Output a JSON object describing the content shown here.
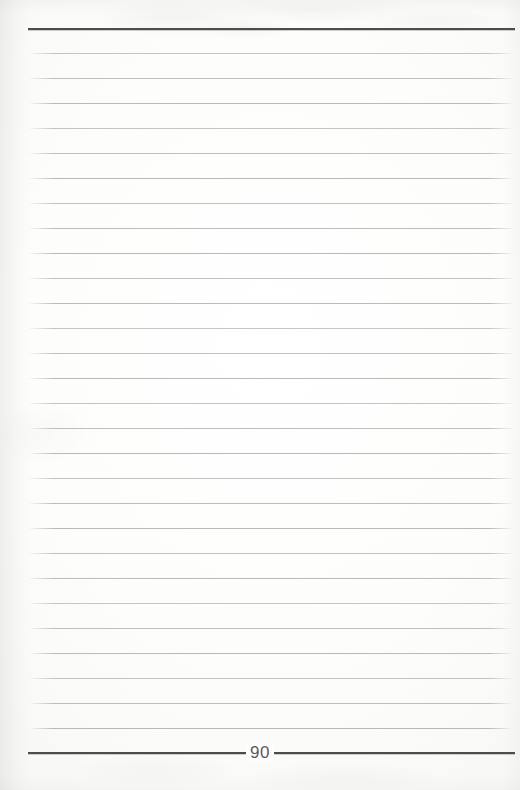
{
  "document": {
    "kind": "scanned-ruled-notebook-page",
    "page_number": "90",
    "page_width": 520,
    "page_height": 790,
    "content_text": ""
  },
  "colors": {
    "paper": "#fdfdfc",
    "rule_line": "#b9b9b7",
    "heavy_rule": "#4d4d4d",
    "page_number_text": "#5a5a5a"
  },
  "layout": {
    "rule_left": 28,
    "rule_right": 515,
    "header_rule_y": 28,
    "footer_rule_y": 752,
    "first_line_y": 53,
    "line_spacing": 25,
    "line_count": 28
  },
  "ruling": {
    "lines": [
      {
        "index": 1,
        "y": 53,
        "text": ""
      },
      {
        "index": 2,
        "y": 78,
        "text": ""
      },
      {
        "index": 3,
        "y": 103,
        "text": ""
      },
      {
        "index": 4,
        "y": 128,
        "text": ""
      },
      {
        "index": 5,
        "y": 153,
        "text": ""
      },
      {
        "index": 6,
        "y": 178,
        "text": ""
      },
      {
        "index": 7,
        "y": 203,
        "text": ""
      },
      {
        "index": 8,
        "y": 228,
        "text": ""
      },
      {
        "index": 9,
        "y": 253,
        "text": ""
      },
      {
        "index": 10,
        "y": 278,
        "text": ""
      },
      {
        "index": 11,
        "y": 303,
        "text": ""
      },
      {
        "index": 12,
        "y": 328,
        "text": ""
      },
      {
        "index": 13,
        "y": 353,
        "text": ""
      },
      {
        "index": 14,
        "y": 378,
        "text": ""
      },
      {
        "index": 15,
        "y": 403,
        "text": ""
      },
      {
        "index": 16,
        "y": 428,
        "text": ""
      },
      {
        "index": 17,
        "y": 453,
        "text": ""
      },
      {
        "index": 18,
        "y": 478,
        "text": ""
      },
      {
        "index": 19,
        "y": 503,
        "text": ""
      },
      {
        "index": 20,
        "y": 528,
        "text": ""
      },
      {
        "index": 21,
        "y": 553,
        "text": ""
      },
      {
        "index": 22,
        "y": 578,
        "text": ""
      },
      {
        "index": 23,
        "y": 603,
        "text": ""
      },
      {
        "index": 24,
        "y": 628,
        "text": ""
      },
      {
        "index": 25,
        "y": 653,
        "text": ""
      },
      {
        "index": 26,
        "y": 678,
        "text": ""
      },
      {
        "index": 27,
        "y": 703,
        "text": ""
      },
      {
        "index": 28,
        "y": 728,
        "text": ""
      }
    ]
  }
}
